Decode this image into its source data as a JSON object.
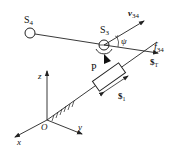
{
  "diagram": {
    "type": "kinematic-mechanism",
    "labels": {
      "s4": "S",
      "s4_sub": "4",
      "s3": "S",
      "s3_sub": "3",
      "v34": "v",
      "v34_sub": "34",
      "psi": "ψ",
      "f34": "f",
      "f34_sub": "34",
      "sT": "$",
      "sT_sub": "T",
      "p": "P",
      "s1": "$",
      "s1_sub": "1",
      "z": "z",
      "o": "O",
      "x": "x",
      "y": "y"
    },
    "colors": {
      "stroke": "#222222",
      "background": "#ffffff"
    }
  }
}
